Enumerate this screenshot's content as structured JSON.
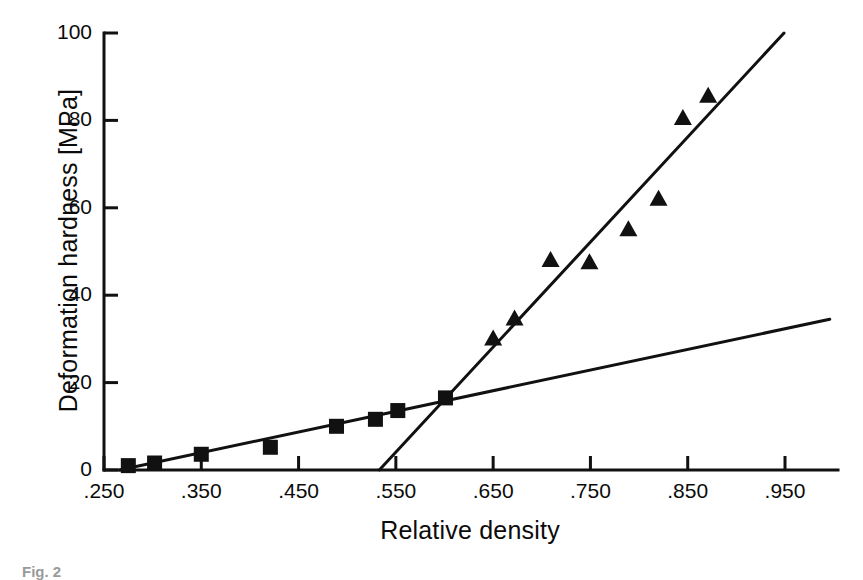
{
  "figure": {
    "caption": "Fig. 2",
    "background_color": "#ffffff",
    "ink_color": "#111111"
  },
  "axes": {
    "y": {
      "title": "Deformation hardness [MPa]",
      "tick_labels": [
        "0",
        "20",
        "40",
        "60",
        "80",
        "100"
      ],
      "tick_values": [
        0,
        20,
        40,
        60,
        80,
        100
      ],
      "range": [
        0,
        100
      ]
    },
    "x": {
      "title": "Relative density",
      "tick_labels": [
        ".250",
        ".350",
        ".450",
        ".550",
        ".650",
        ".750",
        ".850",
        ".950"
      ],
      "tick_values": [
        0.25,
        0.35,
        0.45,
        0.55,
        0.65,
        0.75,
        0.85,
        0.95
      ],
      "range": [
        0.25,
        1.0
      ]
    }
  },
  "chart_data": {
    "type": "scatter",
    "title": "",
    "xlabel": "Relative density",
    "ylabel": "Deformation hardness [MPa]",
    "xlim": [
      0.25,
      1.0
    ],
    "ylim": [
      0,
      100
    ],
    "grid": false,
    "legend": "none",
    "xticks": [
      0.25,
      0.35,
      0.45,
      0.55,
      0.65,
      0.75,
      0.85,
      0.95
    ],
    "yticks": [
      0,
      20,
      40,
      60,
      80,
      100
    ],
    "series": [
      {
        "name": "square-series",
        "marker": "filled-square",
        "color": "#111111",
        "points": [
          {
            "x": 0.275,
            "y": 1.0
          },
          {
            "x": 0.302,
            "y": 1.6
          },
          {
            "x": 0.35,
            "y": 3.6
          },
          {
            "x": 0.421,
            "y": 5.2
          },
          {
            "x": 0.489,
            "y": 10.0
          },
          {
            "x": 0.529,
            "y": 11.6
          },
          {
            "x": 0.552,
            "y": 13.6
          },
          {
            "x": 0.601,
            "y": 16.5
          }
        ]
      },
      {
        "name": "triangle-series",
        "marker": "filled-triangle",
        "color": "#111111",
        "points": [
          {
            "x": 0.65,
            "y": 30.0
          },
          {
            "x": 0.672,
            "y": 34.6
          },
          {
            "x": 0.709,
            "y": 48.0
          },
          {
            "x": 0.749,
            "y": 47.5
          },
          {
            "x": 0.789,
            "y": 55.0
          },
          {
            "x": 0.82,
            "y": 62.0
          },
          {
            "x": 0.845,
            "y": 80.5
          },
          {
            "x": 0.871,
            "y": 85.6
          }
        ]
      }
    ],
    "fit_lines": [
      {
        "name": "shallow-fit-line",
        "color": "#111111",
        "x1": 0.266,
        "y1": 0.0,
        "x2": 0.996,
        "y2": 34.5
      },
      {
        "name": "steep-fit-line",
        "color": "#111111",
        "x1": 0.533,
        "y1": 0.0,
        "x2": 0.949,
        "y2": 100.0
      }
    ]
  }
}
